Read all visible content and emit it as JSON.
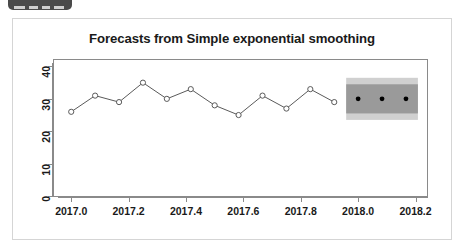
{
  "toolbar": {
    "name": "toolbar-chip",
    "color": "#4a4a4a"
  },
  "card": {
    "border_color": "#d5d5d5",
    "background": "#ffffff"
  },
  "chart_data": {
    "type": "line",
    "title": "Forecasts from Simple exponential smoothing",
    "xlabel": "",
    "ylabel": "",
    "xlim": [
      2016.94,
      2018.24
    ],
    "ylim": [
      0,
      42
    ],
    "grid": false,
    "legend": null,
    "xticks": [
      2017.0,
      2017.2,
      2017.4,
      2017.6,
      2017.8,
      2018.0,
      2018.2
    ],
    "xtick_labels": [
      "2017.0",
      "2017.2",
      "2017.4",
      "2017.6",
      "2017.8",
      "2018.0",
      "2018.2"
    ],
    "yticks": [
      0,
      10,
      20,
      30,
      40
    ],
    "ytick_labels": [
      "0",
      "10",
      "20",
      "30",
      "40"
    ],
    "series": [
      {
        "name": "Observed",
        "marker": "open-circle",
        "color": "#5a5a5a",
        "x": [
          2017.0,
          2017.0833,
          2017.1667,
          2017.25,
          2017.3333,
          2017.4167,
          2017.5,
          2017.5833,
          2017.6667,
          2017.75,
          2017.8333,
          2017.9167
        ],
        "values": [
          26,
          31,
          29,
          35,
          30,
          33,
          28,
          25,
          31,
          27,
          33,
          29
        ]
      },
      {
        "name": "Point forecast",
        "marker": "filled-circle",
        "color": "#000000",
        "x": [
          2018.0,
          2018.0833,
          2018.1667
        ],
        "values": [
          30,
          30,
          30
        ]
      }
    ],
    "intervals": [
      {
        "name": "95% prediction interval",
        "level": 95,
        "color": "#d0d0d0",
        "x": [
          2017.9583,
          2018.2083
        ],
        "lower": [
          23.5,
          23.5
        ],
        "upper": [
          36.5,
          36.5
        ]
      },
      {
        "name": "80% prediction interval",
        "level": 80,
        "color": "#9a9a9a",
        "x": [
          2017.9583,
          2018.2083
        ],
        "lower": [
          25.5,
          25.5
        ],
        "upper": [
          34.5,
          34.5
        ]
      }
    ]
  }
}
